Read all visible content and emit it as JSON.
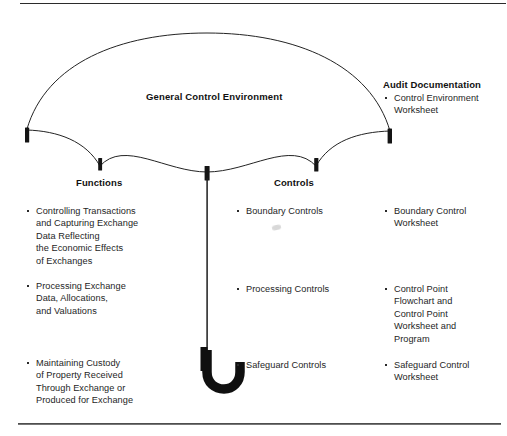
{
  "diagram": {
    "type": "umbrella-diagram",
    "canopy_title": "General Control Environment",
    "stroke_color": "#222222",
    "rib_tip_color": "#111111",
    "background": "#ffffff"
  },
  "columns": {
    "functions": {
      "heading": "Functions",
      "items": [
        "Controlling Transactions\nand Capturing Exchange\nData Reflecting\nthe Economic Effects\nof Exchanges",
        "Processing Exchange\nData, Allocations,\nand Valuations",
        "Maintaining Custody\nof Property Received\nThrough Exchange or\nProduced for Exchange"
      ]
    },
    "controls": {
      "heading": "Controls",
      "items": [
        "Boundary Controls",
        "Processing Controls",
        "Safeguard Controls"
      ]
    },
    "audit_documentation": {
      "heading": "Audit Documentation",
      "items": [
        "Control Environment\nWorksheet",
        "Boundary Control\nWorksheet",
        "Control Point\nFlowchart and\nControl Point\nWorksheet and\nProgram",
        "Safeguard Control\nWorksheet"
      ]
    }
  }
}
